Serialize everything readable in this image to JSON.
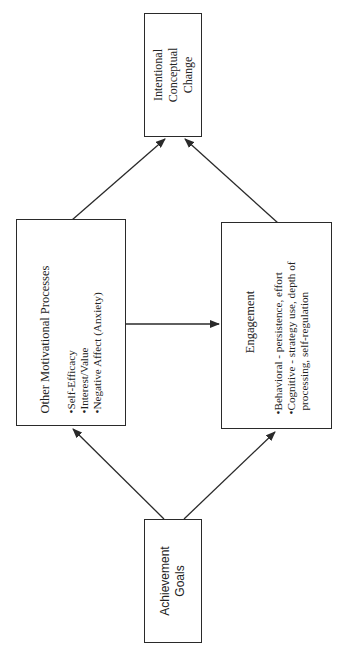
{
  "diagram": {
    "nodes": {
      "intentional_conceptual_change": {
        "lines": [
          "Intentional",
          "Conceptual",
          "Change"
        ]
      },
      "other_motivational_processes": {
        "title": "Other Motivational Processes",
        "bullets": [
          "•Self-Efficacy",
          "•Interest/Value",
          "•Negative Affect (Anxiety)"
        ]
      },
      "engagement": {
        "title": "Engagement",
        "bullets": [
          "•Behavioral - persistence, effort",
          "•Cognitive - strategy use, depth of",
          "processing, self-regulation"
        ]
      },
      "achievement_goals": {
        "lines": [
          "Achievement",
          "Goals"
        ]
      }
    },
    "edges": [
      {
        "from": "Achievement Goals",
        "to": "Other Motivational Processes"
      },
      {
        "from": "Achievement Goals",
        "to": "Engagement"
      },
      {
        "from": "Other Motivational Processes",
        "to": "Engagement"
      },
      {
        "from": "Other Motivational Processes",
        "to": "Intentional Conceptual Change"
      },
      {
        "from": "Engagement",
        "to": "Intentional Conceptual Change"
      }
    ],
    "orientation": "rotated -90deg (text reads bottom-to-top)",
    "colors": {
      "line": "#2a2a2a",
      "background": "#ffffff"
    }
  }
}
